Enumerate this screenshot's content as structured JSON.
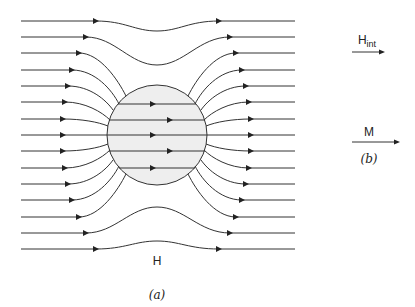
{
  "figure": {
    "panel_a": {
      "caption": "(a)",
      "field_label": "H",
      "sphere": {
        "cx": 157,
        "cy": 135,
        "r": 50,
        "fill": "#eeeeee",
        "stroke": "#333333"
      },
      "line_color": "#333333",
      "row_y": [
        21,
        37,
        53,
        70,
        86,
        102,
        119,
        135,
        151,
        168,
        184,
        200,
        217,
        233,
        249
      ],
      "x_start": 21,
      "x_end": 295
    },
    "panel_b": {
      "caption": "(b)",
      "hint_label": "H",
      "hint_sub": "int",
      "m_label": "M"
    }
  }
}
